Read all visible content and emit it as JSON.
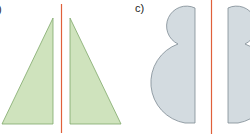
{
  "labels": {
    "left_partial": ")",
    "c": "c)"
  },
  "colors": {
    "triangle_fill": "#cfe3bd",
    "triangle_stroke": "#7fa86a",
    "blob_fill": "#d3dbe0",
    "blob_stroke": "#7d8a93",
    "axis_line": "#e0603a"
  },
  "figures": [
    {
      "id": "b",
      "description": "Two right triangles mirrored about a vertical red line",
      "shapes": [
        "right-triangle-left",
        "right-triangle-right"
      ],
      "axis": "vertical"
    },
    {
      "id": "c",
      "label": "c)",
      "description": "Half-snowman shape (small semicircle atop larger semicircle) mirrored about a vertical red line",
      "shapes": [
        "half-snowman-left",
        "half-snowman-right"
      ],
      "axis": "vertical"
    }
  ]
}
